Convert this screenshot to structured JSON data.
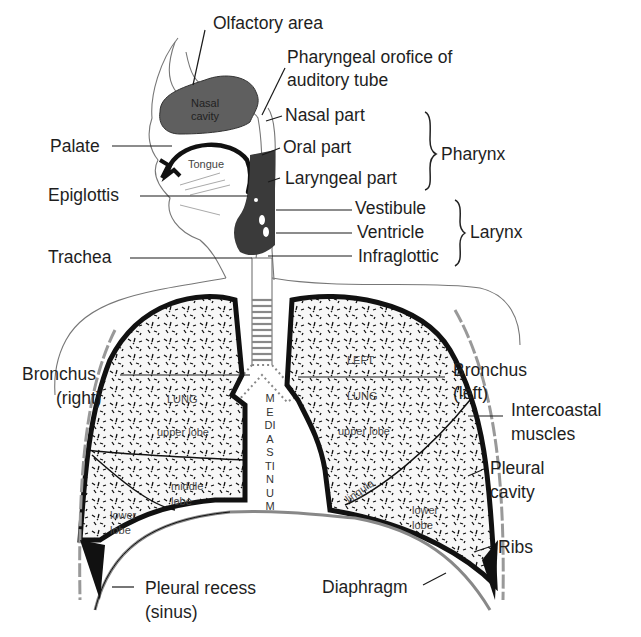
{
  "diagram": {
    "colors": {
      "background": "#ffffff",
      "ink": "#1a1a1a",
      "cavity_fill": "#5f5f5f",
      "lung_fill": "#f4f4f4",
      "outline": "#777777"
    },
    "labels": {
      "olfactory_area": "Olfactory area",
      "pharyngeal_orifice_1": "Pharyngeal orofice of",
      "pharyngeal_orifice_2": "auditory tube",
      "nasal_part": "Nasal part",
      "oral_part": "Oral part",
      "laryngeal_part": "Laryngeal part",
      "pharynx": "Pharynx",
      "vestibule": "Vestibule",
      "ventricle": "Ventricle",
      "infraglottic": "Infraglottic",
      "larynx": "Larynx",
      "palate": "Palate",
      "epiglottis": "Epiglottis",
      "trachea": "Trachea",
      "bronchus_right_1": "Bronchus",
      "bronchus_right_2": "(right)",
      "bronchus_left_1": "Bronchus",
      "bronchus_left_2": "(left)",
      "intercoastal_1": "Intercoastal",
      "intercoastal_2": "muscles",
      "pleural_cavity_1": "Pleural",
      "pleural_cavity_2": "cavity",
      "ribs": "Ribs",
      "diaphragm": "Diaphragm",
      "pleural_recess_1": "Pleural recess",
      "pleural_recess_2": "(sinus)"
    },
    "inner_labels": {
      "nasal_cavity_1": "Nasal",
      "nasal_cavity_2": "cavity",
      "tongue": "Tongue",
      "right_lung": "LUNG",
      "right_upper_lobe": "upper lobe",
      "right_middle_1": "middle",
      "right_middle_2": "lobe",
      "right_lower_1": "lower",
      "right_lower_2": "lobe",
      "left_left": "LEFT",
      "left_lung": "LUNG",
      "left_upper_lobe": "upper lobe",
      "lingula": "lingula",
      "left_lower_1": "lower",
      "left_lower_2": "lobe",
      "mediastinum": "MEDIASTINUM"
    }
  }
}
